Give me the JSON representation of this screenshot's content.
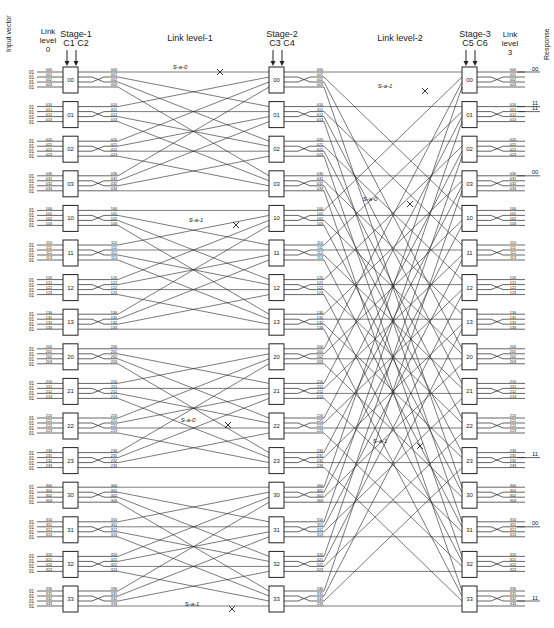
{
  "headers": {
    "input_vector": "Input vector",
    "link_level_0": [
      "Link",
      "level",
      "0"
    ],
    "stage1": {
      "title": "Stage-1",
      "controls": "C1 C2"
    },
    "link_level_1": "Link level-1",
    "stage2": {
      "title": "Stage-2",
      "controls": "C3 C4"
    },
    "link_level_2": "Link level-2",
    "stage3": {
      "title": "Stage-3",
      "controls": "C5 C6"
    },
    "link_level_3": [
      "Link",
      "level",
      "3"
    ],
    "response": "Response"
  },
  "switch_labels": [
    "00",
    "01",
    "02",
    "03",
    "10",
    "11",
    "12",
    "13",
    "20",
    "21",
    "22",
    "23",
    "30",
    "31",
    "32",
    "33"
  ],
  "input_bit": "01",
  "faults": [
    {
      "label": "S-a-0",
      "level": "Link level-1",
      "x": 180,
      "y": 69
    },
    {
      "label": "S-a-1",
      "level": "Link level-1",
      "x": 196,
      "y": 222
    },
    {
      "label": "S-a-0",
      "level": "Link level-1",
      "x": 188,
      "y": 422
    },
    {
      "label": "S-a-1",
      "level": "Link level-1",
      "x": 192,
      "y": 606
    },
    {
      "label": "S-a-1",
      "level": "Link level-2",
      "x": 385,
      "y": 88
    },
    {
      "label": "S-a-0",
      "level": "Link level-2",
      "x": 370,
      "y": 201
    },
    {
      "label": "S-a-1",
      "level": "Link level-2",
      "x": 380,
      "y": 443
    }
  ],
  "responses": [
    {
      "value": "00",
      "switch": "00",
      "line": 0
    },
    {
      "value": "11",
      "switch": "01",
      "line": 0
    },
    {
      "value": "11",
      "switch": "01",
      "line": 1
    },
    {
      "value": "00",
      "switch": "03",
      "line": 0
    },
    {
      "value": "11",
      "switch": "23",
      "line": 1
    },
    {
      "value": "00",
      "switch": "31",
      "line": 1
    },
    {
      "value": "11",
      "switch": "33",
      "line": 2
    }
  ],
  "colors": {
    "ink": "#222222",
    "background": "#ffffff"
  }
}
